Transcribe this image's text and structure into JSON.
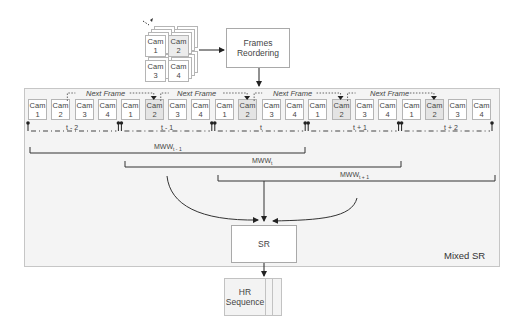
{
  "input_stack": {
    "cameras": [
      {
        "label": "Cam",
        "num": "1"
      },
      {
        "label": "Cam",
        "num": "2"
      },
      {
        "label": "Cam",
        "num": "3"
      },
      {
        "label": "Cam",
        "num": "4"
      }
    ]
  },
  "frames_reordering": {
    "line1": "Frames",
    "line2": "Reordering"
  },
  "sequence": {
    "cameras": [
      {
        "label": "Cam",
        "num": "1",
        "highlight": false
      },
      {
        "label": "Cam",
        "num": "2",
        "highlight": false
      },
      {
        "label": "Cam",
        "num": "3",
        "highlight": false
      },
      {
        "label": "Cam",
        "num": "4",
        "highlight": false
      },
      {
        "label": "Cam",
        "num": "1",
        "highlight": false
      },
      {
        "label": "Cam",
        "num": "2",
        "highlight": true
      },
      {
        "label": "Cam",
        "num": "3",
        "highlight": false
      },
      {
        "label": "Cam",
        "num": "4",
        "highlight": false
      },
      {
        "label": "Cam",
        "num": "1",
        "highlight": false
      },
      {
        "label": "Cam",
        "num": "2",
        "highlight": true
      },
      {
        "label": "Cam",
        "num": "3",
        "highlight": false
      },
      {
        "label": "Cam",
        "num": "4",
        "highlight": false
      },
      {
        "label": "Cam",
        "num": "1",
        "highlight": false
      },
      {
        "label": "Cam",
        "num": "2",
        "highlight": true
      },
      {
        "label": "Cam",
        "num": "3",
        "highlight": false
      },
      {
        "label": "Cam",
        "num": "4",
        "highlight": false
      },
      {
        "label": "Cam",
        "num": "1",
        "highlight": false
      },
      {
        "label": "Cam",
        "num": "2",
        "highlight": true
      },
      {
        "label": "Cam",
        "num": "3",
        "highlight": false
      },
      {
        "label": "Cam",
        "num": "4",
        "highlight": false
      }
    ],
    "next_frame_labels": [
      "Next Frame",
      "Next Frame",
      "Next Frame",
      "Next Frame"
    ],
    "time_labels": [
      "t - 2",
      "t - 1",
      "t",
      "t + 1",
      "t + 2"
    ]
  },
  "windows": [
    {
      "base": "MWW",
      "sub": "t - 1"
    },
    {
      "base": "MWW",
      "sub": "t"
    },
    {
      "base": "MWW",
      "sub": "t + 1"
    }
  ],
  "sr_block": {
    "label": "SR"
  },
  "panel_label": "Mixed SR",
  "output": {
    "line1": "HR",
    "line2": "Sequence"
  }
}
